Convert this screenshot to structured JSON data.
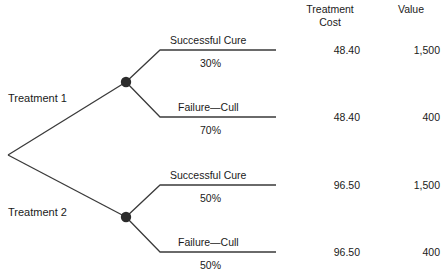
{
  "figure": {
    "type": "decision-tree",
    "root_label": "",
    "columns": [
      {
        "id": "treatment_cost",
        "header_line1": "Treatment",
        "header_line2": "Cost"
      },
      {
        "id": "value",
        "header_line1": "Value",
        "header_line2": ""
      }
    ],
    "decisions": [
      {
        "label": "Treatment 1",
        "branches": [
          {
            "name": "Successful Cure",
            "probability": "30%",
            "treatment_cost": "48.40",
            "value": "1,500"
          },
          {
            "name": "Failure—Cull",
            "probability": "70%",
            "treatment_cost": "48.40",
            "value": "400"
          }
        ]
      },
      {
        "label": "Treatment 2",
        "branches": [
          {
            "name": "Successful Cure",
            "probability": "50%",
            "treatment_cost": "96.50",
            "value": "1,500"
          },
          {
            "name": "Failure—Cull",
            "probability": "50%",
            "treatment_cost": "96.50",
            "value": "400"
          }
        ]
      }
    ],
    "style": {
      "line_color": "#3a3a3a",
      "node_color": "#2b2b2b",
      "text_color": "#1a1a1a",
      "background": "#ffffff"
    }
  }
}
